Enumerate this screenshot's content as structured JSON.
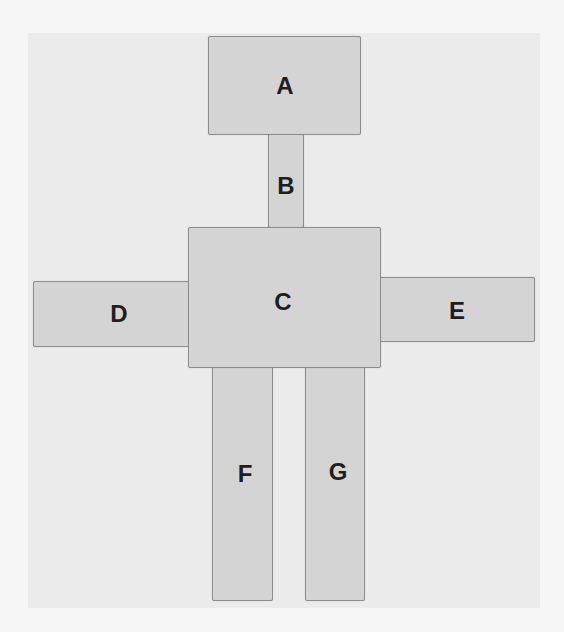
{
  "diagram": {
    "type": "block-figure",
    "colors": {
      "background": "#f6f6f6",
      "panel": "#ebebeb",
      "box_fill": "#d4d4d4",
      "box_border": "#8c8c8c",
      "label": "#1e1e1e"
    },
    "blocks": [
      {
        "id": "A",
        "label": "A",
        "x": 208,
        "y": 36,
        "w": 153,
        "h": 99,
        "lx": 285,
        "ly": 86
      },
      {
        "id": "B",
        "label": "B",
        "x": 268,
        "y": 135,
        "w": 36,
        "h": 92,
        "lx": 286,
        "ly": 186
      },
      {
        "id": "D",
        "label": "D",
        "x": 33,
        "y": 281,
        "w": 158,
        "h": 66,
        "lx": 119,
        "ly": 314
      },
      {
        "id": "E",
        "label": "E",
        "x": 378,
        "y": 277,
        "w": 157,
        "h": 65,
        "lx": 457,
        "ly": 311
      },
      {
        "id": "F",
        "label": "F",
        "x": 212,
        "y": 366,
        "w": 61,
        "h": 235,
        "lx": 245,
        "ly": 474
      },
      {
        "id": "G",
        "label": "G",
        "x": 305,
        "y": 366,
        "w": 60,
        "h": 235,
        "lx": 338,
        "ly": 472
      },
      {
        "id": "C",
        "label": "C",
        "x": 188,
        "y": 227,
        "w": 193,
        "h": 141,
        "lx": 283,
        "ly": 302
      }
    ],
    "connections": [
      {
        "from": "A",
        "to": "B"
      },
      {
        "from": "B",
        "to": "C"
      },
      {
        "from": "C",
        "to": "D"
      },
      {
        "from": "C",
        "to": "E"
      },
      {
        "from": "C",
        "to": "F"
      },
      {
        "from": "C",
        "to": "G"
      }
    ]
  }
}
